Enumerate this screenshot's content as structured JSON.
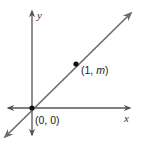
{
  "diagram": {
    "type": "coordinate-plane-line",
    "axes": {
      "x_label": "x",
      "y_label": "y"
    },
    "points": [
      {
        "label_open": "(0, 0)",
        "coords": [
          0,
          0
        ]
      },
      {
        "label_prefix": "(1, ",
        "label_var": "m",
        "label_suffix": ")",
        "coords": [
          1,
          "m"
        ]
      }
    ],
    "line": {
      "passes_through": [
        "(0, 0)",
        "(1, m)"
      ],
      "arrows_both_ends": true
    },
    "colors": {
      "axis": "#555555",
      "line": "#6b6b6b",
      "point": "#111111",
      "text": "#222222"
    }
  }
}
